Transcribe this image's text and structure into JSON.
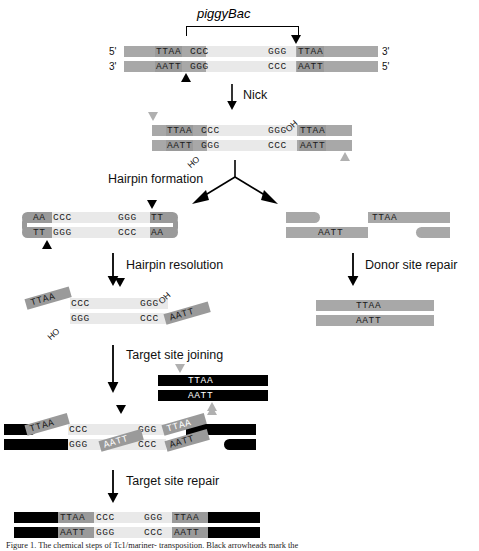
{
  "figure": {
    "transposon_label": "piggyBac",
    "caption": "Figure 1. The chemical steps of Tc1/mariner-  transposition. Black arrowheads mark the"
  },
  "steps": {
    "nick": "Nick",
    "hairpin_formation": "Hairpin formation",
    "hairpin_resolution": "Hairpin resolution",
    "donor_site_repair": "Donor site repair",
    "target_site_joining": "Target site joining",
    "target_site_repair": "Target site repair"
  },
  "ends": {
    "five_prime": "5'",
    "three_prime": "3'"
  },
  "sequences": {
    "ttaa": "TTAA",
    "aatt": "AATT",
    "ccc": "CCC",
    "ggg": "GGG",
    "aa": "AA",
    "tt": "TT",
    "oh": "OH",
    "ho": "HO"
  },
  "panels": {
    "substrate": {
      "name": "donor-substrate-duplex",
      "top_strand": [
        "TTAA",
        "CCC",
        "GGG",
        "TTAA"
      ],
      "bottom_strand": [
        "AATT",
        "GGG",
        "CCC",
        "AATT"
      ],
      "left_end_top": "5'",
      "left_end_bottom": "3'",
      "right_end_top": "3'",
      "right_end_bottom": "5'"
    },
    "nicked": {
      "name": "nicked-duplex",
      "top_strand": [
        "TTAA",
        "CCC",
        "GGG",
        "TTAA"
      ],
      "bottom_strand": [
        "AATT",
        "GGG",
        "CCC",
        "AATT"
      ],
      "oh_top_right": "OH",
      "ho_bottom_left": "HO"
    },
    "hairpin": {
      "name": "hairpin-intermediate",
      "top_strand": [
        "AA",
        "CCC",
        "GGG",
        "TT"
      ],
      "bottom_strand": [
        "TT",
        "GGG",
        "CCC",
        "AA"
      ]
    },
    "excised_donor": {
      "name": "excised-donor-fragments",
      "top_strand": [
        "TTAA"
      ],
      "bottom_strand": [
        "AATT"
      ]
    },
    "repaired_donor": {
      "name": "repaired-donor-duplex",
      "top_strand": [
        "TTAA"
      ],
      "bottom_strand": [
        "AATT"
      ]
    },
    "resolved": {
      "name": "resolved-transposon",
      "top_strand": [
        "TTAA",
        "CCC",
        "GGG"
      ],
      "bottom_strand": [
        "GGG",
        "CCC",
        "AATT"
      ],
      "oh_top_right": "OH",
      "ho_bottom_left": "HO"
    },
    "target": {
      "name": "target-site-duplex",
      "top_strand": [
        "TTAA"
      ],
      "bottom_strand": [
        "AATT"
      ]
    },
    "joined": {
      "name": "target-joined-intermediate",
      "top_strand": [
        "TTAA",
        "CCC",
        "GGG",
        "TTAA"
      ],
      "bottom_strand": [
        "AATT",
        "GGG",
        "CCC",
        "AATT"
      ]
    },
    "integrated": {
      "name": "integrated-product",
      "top_strand": [
        "TTAA",
        "CCC",
        "GGG",
        "TTAA"
      ],
      "bottom_strand": [
        "AATT",
        "GGG",
        "CCC",
        "AATT"
      ]
    }
  },
  "colors": {
    "donor_flank": "#a8a8a8",
    "transposon_body": "#e9e9e9",
    "ttaa_box": "#9a9a9a",
    "target_dna": "#000000",
    "arrow_black": "#000000",
    "arrow_gray": "#b0b0b0"
  }
}
